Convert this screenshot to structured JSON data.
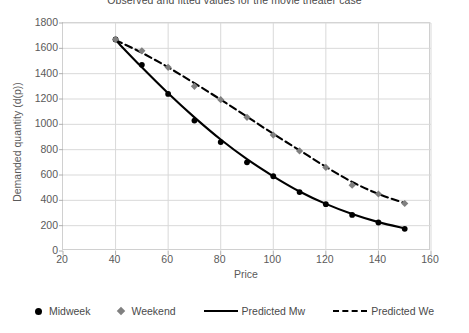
{
  "chart_data": {
    "type": "scatter",
    "title": "Observed and fitted values for the movie theater case",
    "xlabel": "Price",
    "ylabel": "Demanded quantity (d(p))",
    "xlim": [
      20,
      160
    ],
    "ylim": [
      0,
      1800
    ],
    "xticks": [
      20,
      40,
      60,
      80,
      100,
      120,
      140,
      160
    ],
    "yticks": [
      0,
      200,
      400,
      600,
      800,
      1000,
      1200,
      1400,
      1600,
      1800
    ],
    "grid": true,
    "legend_position": "bottom",
    "x": [
      40,
      50,
      60,
      70,
      80,
      90,
      100,
      110,
      120,
      130,
      140,
      150
    ],
    "series": [
      {
        "name": "Midweek",
        "type": "scatter",
        "marker": "circle",
        "color": "#000000",
        "values": [
          1670,
          1470,
          1240,
          1030,
          860,
          700,
          590,
          465,
          370,
          285,
          225,
          175
        ]
      },
      {
        "name": "Weekend",
        "type": "scatter",
        "marker": "diamond",
        "color": "#808080",
        "values": [
          1670,
          1580,
          1450,
          1300,
          1195,
          1055,
          915,
          790,
          660,
          520,
          450,
          375
        ]
      },
      {
        "name": "Predicted Mw",
        "type": "line",
        "style": "solid",
        "color": "#000000",
        "values": [
          1665,
          1450,
          1245,
          1055,
          880,
          725,
          590,
          470,
          372,
          292,
          228,
          178
        ]
      },
      {
        "name": "Predicted We",
        "type": "line",
        "style": "dashed",
        "color": "#000000",
        "values": [
          1665,
          1565,
          1450,
          1325,
          1195,
          1060,
          925,
          795,
          665,
          545,
          450,
          378
        ]
      }
    ]
  },
  "legend": {
    "items": [
      {
        "label": "Midweek",
        "marker": "circle-marker"
      },
      {
        "label": "Weekend",
        "marker": "diamond-marker"
      },
      {
        "label": "Predicted Mw",
        "marker": "solid-line-swatch"
      },
      {
        "label": "Predicted We",
        "marker": "dashed-line-swatch"
      }
    ]
  }
}
